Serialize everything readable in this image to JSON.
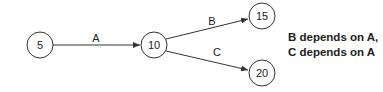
{
  "nodes": [
    {
      "id": "n5",
      "label": "5"
    },
    {
      "id": "n10",
      "label": "10"
    },
    {
      "id": "n15",
      "label": "15"
    },
    {
      "id": "n20",
      "label": "20"
    }
  ],
  "edges": [
    {
      "from": "5",
      "to": "10",
      "label": "A"
    },
    {
      "from": "10",
      "to": "15",
      "label": "B"
    },
    {
      "from": "10",
      "to": "20",
      "label": "C"
    }
  ],
  "note": {
    "line1": "B depends on A,",
    "line2": "C depends on A"
  }
}
